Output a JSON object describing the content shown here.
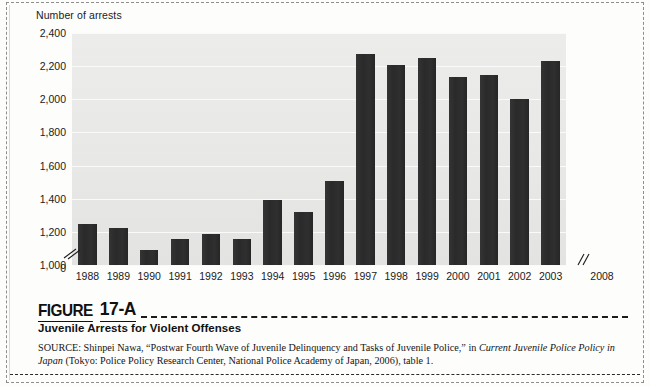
{
  "figure": {
    "label_word": "FIGURE",
    "label_number": "17-A",
    "subtitle": "Juvenile Arrests for Violent Offenses",
    "source_prefix": "SOURCE: Shinpei Nawa, “Postwar Fourth Wave of Juvenile Delinquency and Tasks of Juvenile Police,” in ",
    "source_italic_1": "Current Juvenile Police Policy in Japan",
    "source_middle": " (Tokyo: Police Policy Research Center, National Police Academy of Japan, 2006), table 1.",
    "source_full": "SOURCE: Shinpei Nawa, “Postwar Fourth Wave of Juvenile Delinquency and Tasks of Juvenile Police,” in Current Juvenile Police Policy in Japan (Tokyo: Police Policy Research Center, National Police Academy of Japan, 2006), table 1."
  },
  "colors": {
    "bar": "#2a2a2a",
    "plot_background": "#eaeae8",
    "gridline": "#fafafa",
    "text": "#1b1b1b",
    "border_dashed": "#8d8d8d"
  },
  "chart_data": {
    "type": "bar",
    "title": "Juvenile Arrests for Violent Offenses",
    "axis_title": "Number of arrests",
    "xlabel": "",
    "ylabel": "Number of arrests",
    "ylim": [
      1000,
      2400
    ],
    "y_axis_has_break": true,
    "y_break_between": [
      0,
      1000
    ],
    "x_axis_has_break": true,
    "x_break_between": [
      "2003",
      "2008"
    ],
    "grid": true,
    "legend": "none",
    "ytick_labels": [
      "2,400",
      "2,200",
      "2,000",
      "1,800",
      "1,600",
      "1,400",
      "1,200",
      "1,000",
      "0"
    ],
    "ytick_values": [
      2400,
      2200,
      2000,
      1800,
      1600,
      1400,
      1200,
      1000,
      0
    ],
    "categories": [
      "1988",
      "1989",
      "1990",
      "1991",
      "1992",
      "1993",
      "1994",
      "1995",
      "1996",
      "1997",
      "1998",
      "1999",
      "2000",
      "2001",
      "2002",
      "2003",
      "2008"
    ],
    "values": [
      1250,
      1225,
      1090,
      1160,
      1185,
      1155,
      1390,
      1320,
      1510,
      2275,
      2205,
      2250,
      2135,
      2145,
      2000,
      2230,
      null
    ],
    "series": [
      {
        "name": "Number of arrests",
        "values": [
          1250,
          1225,
          1090,
          1160,
          1185,
          1155,
          1390,
          1320,
          1510,
          2275,
          2205,
          2250,
          2135,
          2145,
          2000,
          2230,
          null
        ]
      }
    ]
  }
}
